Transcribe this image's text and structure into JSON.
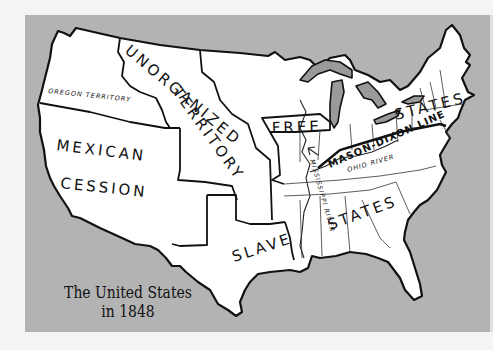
{
  "map": {
    "title_line1": "The United States",
    "title_line2": "in 1848",
    "colors": {
      "page_background": "#f4f4f4",
      "frame_background": "#b3b3b3",
      "land": "#ffffff",
      "lakes": "#9a9a9a",
      "outline": "#111111"
    },
    "region_labels": {
      "oregon_territory": "OREGON TERRITORY",
      "unorganized_line1": "UNORGANIZED",
      "unorganized_line2": "TERRITORY",
      "mexican": "MEXICAN",
      "cession": "CESSION",
      "free": "FREE",
      "free_states": "STATES",
      "slave": "SLAVE",
      "slave_states": "STATES"
    },
    "line_labels": {
      "mason_dixon": "MASON-DIXON LINE",
      "ohio_river": "OHIO RIVER",
      "mississippi_river": "MISSISSIPPI RIVER"
    }
  }
}
